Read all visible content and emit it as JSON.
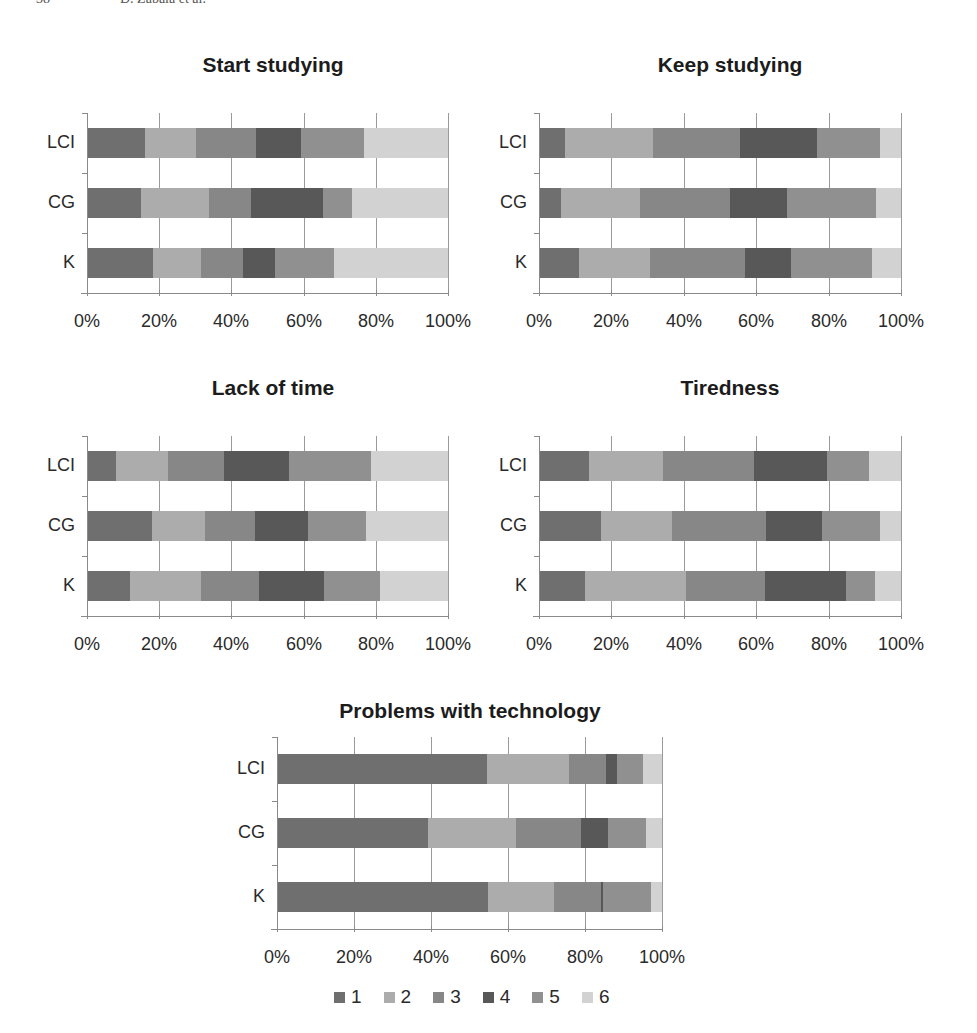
{
  "page_header": {
    "page_number": "38",
    "author": "D. Zabala et al."
  },
  "colors": {
    "1": "#6f6f6f",
    "2": "#acacac",
    "3": "#878787",
    "4": "#585858",
    "5": "#909090",
    "6": "#d2d2d2"
  },
  "legend": [
    {
      "key": "1",
      "label": "1"
    },
    {
      "key": "2",
      "label": "2"
    },
    {
      "key": "3",
      "label": "3"
    },
    {
      "key": "4",
      "label": "4"
    },
    {
      "key": "5",
      "label": "5"
    },
    {
      "key": "6",
      "label": "6"
    }
  ],
  "x_ticks": [
    "0%",
    "20%",
    "40%",
    "60%",
    "80%",
    "100%"
  ],
  "chart_data": [
    {
      "type": "bar",
      "orientation": "horizontal",
      "stacked": "percent",
      "title": "Start studying",
      "categories": [
        "LCI",
        "CG",
        "K"
      ],
      "series": [
        {
          "name": "1",
          "values": [
            15.7,
            14.8,
            18.0
          ]
        },
        {
          "name": "2",
          "values": [
            14.3,
            18.9,
            13.4
          ]
        },
        {
          "name": "3",
          "values": [
            16.6,
            11.7,
            11.7
          ]
        },
        {
          "name": "4",
          "values": [
            12.5,
            19.9,
            8.9
          ]
        },
        {
          "name": "5",
          "values": [
            17.5,
            8.1,
            16.3
          ]
        },
        {
          "name": "6",
          "values": [
            23.4,
            26.6,
            31.7
          ]
        }
      ],
      "xlabel": "",
      "ylabel": "",
      "xlim": [
        0,
        100
      ],
      "grid": true,
      "legend_position": "bottom"
    },
    {
      "type": "bar",
      "orientation": "horizontal",
      "stacked": "percent",
      "title": "Keep studying",
      "categories": [
        "LCI",
        "CG",
        "K"
      ],
      "series": [
        {
          "name": "1",
          "values": [
            6.8,
            5.9,
            10.8
          ]
        },
        {
          "name": "2",
          "values": [
            24.4,
            21.9,
            19.7
          ]
        },
        {
          "name": "3",
          "values": [
            24.2,
            24.8,
            26.3
          ]
        },
        {
          "name": "4",
          "values": [
            21.4,
            15.7,
            12.7
          ]
        },
        {
          "name": "5",
          "values": [
            17.5,
            24.8,
            22.5
          ]
        },
        {
          "name": "6",
          "values": [
            5.7,
            6.9,
            8.0
          ]
        }
      ],
      "xlabel": "",
      "ylabel": "",
      "xlim": [
        0,
        100
      ],
      "grid": true,
      "legend_position": "bottom"
    },
    {
      "type": "bar",
      "orientation": "horizontal",
      "stacked": "percent",
      "title": "Lack of time",
      "categories": [
        "LCI",
        "CG",
        "K"
      ],
      "series": [
        {
          "name": "1",
          "values": [
            7.7,
            17.7,
            11.7
          ]
        },
        {
          "name": "2",
          "values": [
            14.5,
            14.8,
            19.7
          ]
        },
        {
          "name": "3",
          "values": [
            15.5,
            13.9,
            16.2
          ]
        },
        {
          "name": "4",
          "values": [
            18.2,
            14.8,
            18.0
          ]
        },
        {
          "name": "5",
          "values": [
            22.8,
            16.1,
            15.4
          ]
        },
        {
          "name": "6",
          "values": [
            21.3,
            22.7,
            19.0
          ]
        }
      ],
      "xlabel": "",
      "ylabel": "",
      "xlim": [
        0,
        100
      ],
      "grid": true,
      "legend_position": "bottom"
    },
    {
      "type": "bar",
      "orientation": "horizontal",
      "stacked": "percent",
      "title": "Tiredness",
      "categories": [
        "LCI",
        "CG",
        "K"
      ],
      "series": [
        {
          "name": "1",
          "values": [
            13.5,
            16.8,
            12.5
          ]
        },
        {
          "name": "2",
          "values": [
            20.6,
            19.9,
            28.0
          ]
        },
        {
          "name": "3",
          "values": [
            25.1,
            25.8,
            21.8
          ]
        },
        {
          "name": "4",
          "values": [
            20.2,
            15.7,
            22.4
          ]
        },
        {
          "name": "5",
          "values": [
            11.8,
            16.0,
            8.1
          ]
        },
        {
          "name": "6",
          "values": [
            8.8,
            5.8,
            7.2
          ]
        }
      ],
      "xlabel": "",
      "ylabel": "",
      "xlim": [
        0,
        100
      ],
      "grid": true,
      "legend_position": "bottom"
    },
    {
      "type": "bar",
      "orientation": "horizontal",
      "stacked": "percent",
      "title": "Problems with technology",
      "categories": [
        "LCI",
        "CG",
        "K"
      ],
      "series": [
        {
          "name": "1",
          "values": [
            54.4,
            39.0,
            54.8
          ]
        },
        {
          "name": "2",
          "values": [
            21.4,
            22.9,
            17.1
          ]
        },
        {
          "name": "3",
          "values": [
            9.7,
            17.1,
            12.1
          ]
        },
        {
          "name": "4",
          "values": [
            2.9,
            7.0,
            0.7
          ]
        },
        {
          "name": "5",
          "values": [
            6.7,
            9.9,
            12.5
          ]
        },
        {
          "name": "6",
          "values": [
            4.9,
            4.1,
            2.8
          ]
        }
      ],
      "xlabel": "",
      "ylabel": "",
      "xlim": [
        0,
        100
      ],
      "grid": true,
      "legend_position": "bottom"
    }
  ]
}
